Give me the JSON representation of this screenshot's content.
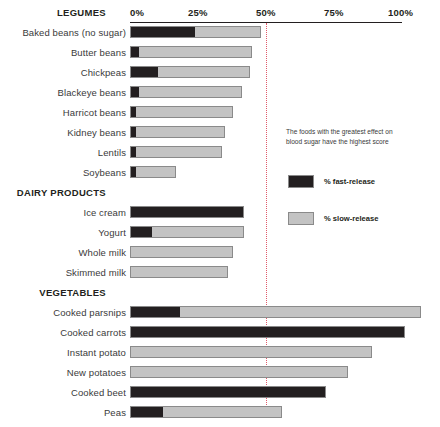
{
  "chart_data": {
    "type": "bar",
    "title": "",
    "xlabel": "",
    "ylabel": "",
    "orientation": "horizontal",
    "stacked": true,
    "xlim": [
      0,
      110
    ],
    "grid": "dotted vertical line at 50%",
    "gridline_value": 50,
    "legend_position": "right-middle",
    "axis_ticks": [
      "0%",
      "25%",
      "50%",
      "75%",
      "100%"
    ],
    "axis_tick_values": [
      0,
      25,
      50,
      75,
      100
    ],
    "series": [
      {
        "name": "% fast-release",
        "color": "#231f20"
      },
      {
        "name": "% slow-release",
        "color": "#c3c3c3"
      }
    ],
    "sections": [
      {
        "header": "LEGUMES",
        "rows": [
          {
            "label": "Baked beans (no sugar)",
            "fast": 24,
            "slow": 24,
            "total": 48
          },
          {
            "label": "Butter beans",
            "fast": 3,
            "slow": 42,
            "total": 45
          },
          {
            "label": "Chickpeas",
            "fast": 10,
            "slow": 34,
            "total": 44
          },
          {
            "label": "Blackeye beans",
            "fast": 3,
            "slow": 38,
            "total": 41
          },
          {
            "label": "Harricot beans",
            "fast": 2,
            "slow": 36,
            "total": 38
          },
          {
            "label": "Kidney beans",
            "fast": 2,
            "slow": 33,
            "total": 35
          },
          {
            "label": "Lentils",
            "fast": 2,
            "slow": 32,
            "total": 34
          },
          {
            "label": "Soybeans",
            "fast": 2,
            "slow": 15,
            "total": 17
          }
        ]
      },
      {
        "header": "DAIRY PRODUCTS",
        "rows": [
          {
            "label": "Ice cream",
            "fast": 42,
            "slow": 0,
            "total": 42
          },
          {
            "label": "Yogurt",
            "fast": 8,
            "slow": 34,
            "total": 42
          },
          {
            "label": "Whole milk",
            "fast": 0,
            "slow": 38,
            "total": 38
          },
          {
            "label": "Skimmed milk",
            "fast": 0,
            "slow": 36,
            "total": 36
          }
        ]
      },
      {
        "header": "VEGETABLES",
        "rows": [
          {
            "label": "Cooked parsnips",
            "fast": 18,
            "slow": 89,
            "total": 107
          },
          {
            "label": "Cooked carrots",
            "fast": 101,
            "slow": 0,
            "total": 101
          },
          {
            "label": "Instant potato",
            "fast": 0,
            "slow": 89,
            "total": 89
          },
          {
            "label": "New potatoes",
            "fast": 0,
            "slow": 80,
            "total": 80
          },
          {
            "label": "Cooked beet",
            "fast": 72,
            "slow": 0,
            "total": 72
          },
          {
            "label": "Peas",
            "fast": 12,
            "slow": 44,
            "total": 56
          }
        ]
      }
    ],
    "annotation": "The foods with the greatest effect on blood sugar have the highest score"
  },
  "legend": {
    "fast_label": "% fast-release",
    "slow_label": "% slow-release"
  },
  "colors": {
    "fast": "#231f20",
    "slow": "#c3c3c3",
    "gridline": "#e05a6b",
    "text": "#231f20"
  }
}
